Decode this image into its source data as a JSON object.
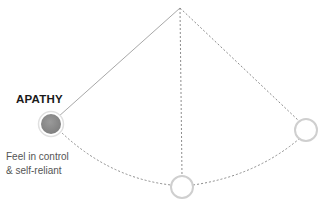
{
  "diagram": {
    "type": "pendulum",
    "apex": {
      "x": 180,
      "y": 8
    },
    "nodes": [
      {
        "id": "apathy",
        "label": "APATHY",
        "description_lines": [
          "Feel in control",
          "& self-reliant"
        ],
        "x": 51,
        "y": 124,
        "r": 10,
        "fill": "#8a8a8a",
        "active": true
      },
      {
        "id": "bottom",
        "label": "",
        "x": 182,
        "y": 187,
        "r": 11,
        "fill": "#ffffff",
        "active": false
      },
      {
        "id": "right",
        "label": "",
        "x": 306,
        "y": 130,
        "r": 11,
        "fill": "#ffffff",
        "active": false
      }
    ],
    "colors": {
      "line": "#9a9a9a",
      "ring": "#cfcfcf",
      "active_fill": "#8a8a8a"
    }
  }
}
